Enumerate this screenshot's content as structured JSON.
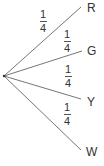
{
  "diagram": {
    "type": "probability-tree",
    "root": {
      "x": 4,
      "y": 76
    },
    "line_color": "#666666",
    "branches": [
      {
        "outcome": "R",
        "probability": {
          "numerator": "1",
          "denominator": "4"
        },
        "end": {
          "x": 81,
          "y": 7
        },
        "label_pos": {
          "x": 87,
          "y": 2
        },
        "frac_pos": {
          "x": 38,
          "y": 9
        }
      },
      {
        "outcome": "G",
        "probability": {
          "numerator": "1",
          "denominator": "4"
        },
        "end": {
          "x": 82,
          "y": 51
        },
        "label_pos": {
          "x": 87,
          "y": 45
        },
        "frac_pos": {
          "x": 62,
          "y": 29
        }
      },
      {
        "outcome": "Y",
        "probability": {
          "numerator": "1",
          "denominator": "4"
        },
        "end": {
          "x": 81,
          "y": 99
        },
        "label_pos": {
          "x": 87,
          "y": 96
        },
        "frac_pos": {
          "x": 63,
          "y": 64
        }
      },
      {
        "outcome": "W",
        "probability": {
          "numerator": "1",
          "denominator": "4"
        },
        "end": {
          "x": 81,
          "y": 150
        },
        "label_pos": {
          "x": 87,
          "y": 146
        },
        "frac_pos": {
          "x": 62,
          "y": 102
        }
      }
    ]
  }
}
